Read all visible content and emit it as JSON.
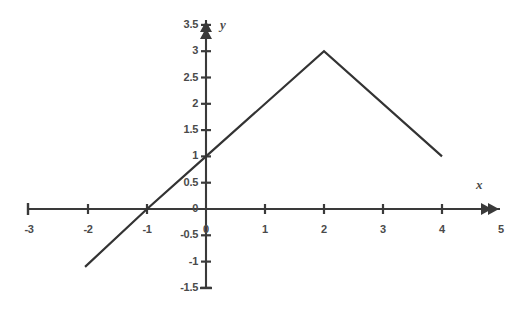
{
  "chart_data": {
    "type": "line",
    "title": "",
    "subtitle": "",
    "xlabel": "x",
    "ylabel": "y",
    "xlim": [
      -3,
      5
    ],
    "ylim": [
      -1.5,
      3.5
    ],
    "grid": false,
    "legend": null,
    "x_ticks": [
      -3,
      -2,
      -1,
      0,
      1,
      2,
      3,
      4,
      5
    ],
    "x_tick_labels": [
      "-3",
      "-2",
      "-1",
      "0",
      "1",
      "2",
      "3",
      "4",
      "5"
    ],
    "y_ticks": [
      -1.5,
      -1,
      -0.5,
      0,
      0.5,
      1,
      1.5,
      2,
      2.5,
      3,
      3.5
    ],
    "y_tick_labels": [
      "-1.5",
      "-1",
      "-0.5",
      "0",
      "0.5",
      "1",
      "1.5",
      "2",
      "2.5",
      "3",
      "3.5"
    ],
    "series": [
      {
        "name": "piecewise-linear",
        "points": [
          {
            "x": -2.05,
            "y": -1.1
          },
          {
            "x": -1,
            "y": 0
          },
          {
            "x": 0,
            "y": 1
          },
          {
            "x": 2,
            "y": 3
          },
          {
            "x": 4,
            "y": 1
          }
        ],
        "color": "#333333",
        "width": 2.2
      }
    ],
    "annotations": [
      {
        "name": "peak",
        "x": 2,
        "y": 3
      },
      {
        "name": "x-intercept",
        "x": -1,
        "y": 0
      },
      {
        "name": "y-intercept",
        "x": 0,
        "y": 1
      }
    ]
  },
  "axes": {
    "x_axis_label": "x",
    "y_axis_label": "y",
    "x_origin_label": "0",
    "y_origin_label": "0",
    "line_color": "#333333",
    "axis_color": "#3a3a3a",
    "tick_text_color": "#4a4a4a",
    "background": "#ffffff"
  },
  "geometry": {
    "origin_px": {
      "x": 206,
      "y": 209
    },
    "x_unit_px": 59,
    "y_unit_px": 52.6,
    "x_axis_left_px": 28,
    "x_axis_right_px": 500,
    "y_axis_top_px": 20,
    "y_axis_bottom_px": 288
  }
}
